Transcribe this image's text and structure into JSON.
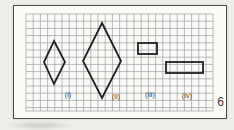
{
  "figure": {
    "page_number": "6",
    "grid": {
      "x": 26,
      "y": 14,
      "width": 187,
      "height": 97,
      "cell": 7.2,
      "line_color": "#9aa0a3",
      "line_width": 0.7
    },
    "ink_color": "#212121",
    "ink_width": 1.8,
    "label_color": "#454545",
    "label_font_size": 7.5,
    "shapes": [
      {
        "name": "rhombus-i",
        "type": "polygon",
        "points": [
          [
            54,
            41
          ],
          [
            65,
            62
          ],
          [
            54,
            84
          ],
          [
            44,
            62
          ]
        ]
      },
      {
        "name": "rhombus-ii",
        "type": "polygon",
        "points": [
          [
            102,
            23
          ],
          [
            121,
            61
          ],
          [
            102,
            98
          ],
          [
            83,
            61
          ]
        ]
      },
      {
        "name": "rectangle-iii",
        "type": "rect",
        "x": 138,
        "y": 43,
        "width": 19,
        "height": 11
      },
      {
        "name": "rectangle-iv",
        "type": "rect",
        "x": 166,
        "y": 62,
        "width": 37,
        "height": 11
      }
    ],
    "labels": [
      {
        "name": "shape-label-i",
        "text": "(i)",
        "x": 68,
        "y": 94
      },
      {
        "name": "shape-label-ii",
        "text": "(ii)",
        "x": 116,
        "y": 96
      },
      {
        "name": "shape-label-iii",
        "text": "(iii)",
        "x": 150,
        "y": 94
      },
      {
        "name": "shape-label-iv",
        "text": "(iv)",
        "x": 187,
        "y": 95
      }
    ]
  }
}
